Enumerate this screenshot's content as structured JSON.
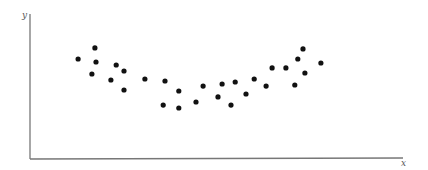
{
  "chart_data": {
    "type": "scatter",
    "title": "",
    "xlabel": "x",
    "ylabel": "y",
    "xlim": [
      0,
      100
    ],
    "ylim": [
      0,
      100
    ],
    "grid": false,
    "legend": null,
    "ticks": {
      "x": [],
      "y": []
    },
    "series": [
      {
        "name": "points",
        "color": "#111111",
        "marker_radius": 2.6,
        "points": [
          {
            "x": 12.9,
            "y": 69.0
          },
          {
            "x": 17.4,
            "y": 76.6
          },
          {
            "x": 17.7,
            "y": 66.9
          },
          {
            "x": 16.6,
            "y": 58.6
          },
          {
            "x": 23.1,
            "y": 64.8
          },
          {
            "x": 25.2,
            "y": 60.7
          },
          {
            "x": 21.7,
            "y": 54.5
          },
          {
            "x": 25.2,
            "y": 47.6
          },
          {
            "x": 30.8,
            "y": 55.2
          },
          {
            "x": 36.2,
            "y": 53.8
          },
          {
            "x": 35.7,
            "y": 37.2
          },
          {
            "x": 39.9,
            "y": 46.9
          },
          {
            "x": 39.9,
            "y": 35.2
          },
          {
            "x": 44.5,
            "y": 39.3
          },
          {
            "x": 46.4,
            "y": 50.3
          },
          {
            "x": 50.4,
            "y": 42.8
          },
          {
            "x": 51.5,
            "y": 51.7
          },
          {
            "x": 53.9,
            "y": 37.2
          },
          {
            "x": 55.0,
            "y": 53.1
          },
          {
            "x": 57.9,
            "y": 44.8
          },
          {
            "x": 60.1,
            "y": 55.2
          },
          {
            "x": 63.3,
            "y": 50.3
          },
          {
            "x": 64.9,
            "y": 62.8
          },
          {
            "x": 68.6,
            "y": 62.8
          },
          {
            "x": 71.0,
            "y": 51.0
          },
          {
            "x": 71.8,
            "y": 69.0
          },
          {
            "x": 73.2,
            "y": 75.9
          },
          {
            "x": 73.7,
            "y": 59.3
          },
          {
            "x": 78.0,
            "y": 66.2
          }
        ]
      }
    ],
    "axis_color": "#777777",
    "annotations": []
  }
}
